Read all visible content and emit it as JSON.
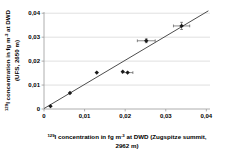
{
  "chart_data": {
    "type": "scatter",
    "title": "",
    "xlabel_plain": "129I concentration in fg m-3 at DWD (Zugspitze summit, 2962 m)",
    "ylabel_plain": "129I concentration in fg m-3 at DWD (UFS, 2650 m)",
    "xlabel_lines": [
      [
        {
          "sup": "129"
        },
        {
          "t": "I concentration in fg m"
        },
        {
          "sup": "-3"
        },
        {
          "t": " at DWD (Zugspitze summit,"
        }
      ],
      [
        {
          "t": "2962 m)"
        }
      ]
    ],
    "ylabel_lines": [
      [
        {
          "sup": "129"
        },
        {
          "t": "I concentration in fg m"
        },
        {
          "sup": "-3"
        },
        {
          "t": " at DWD"
        }
      ],
      [
        {
          "t": "(UFS, 2650 m)"
        }
      ]
    ],
    "x_ticks": [
      {
        "value": 0,
        "label": "0"
      },
      {
        "value": 0.01,
        "label": "0,01"
      },
      {
        "value": 0.02,
        "label": "0,02"
      },
      {
        "value": 0.03,
        "label": "0,03"
      },
      {
        "value": 0.04,
        "label": "0,04"
      }
    ],
    "y_ticks": [
      {
        "value": 0,
        "label": "0"
      },
      {
        "value": 0.01,
        "label": "0,01"
      },
      {
        "value": 0.02,
        "label": "0,02"
      },
      {
        "value": 0.03,
        "label": "0,03"
      },
      {
        "value": 0.04,
        "label": "0,04"
      }
    ],
    "xlim": [
      0,
      0.0409
    ],
    "ylim": [
      0,
      0.0411
    ],
    "grid": "horizontal-only",
    "legend": "none",
    "points": [
      {
        "x": 0.0016,
        "y": 0.0012,
        "xerr": 0.0004,
        "yerr": 0
      },
      {
        "x": 0.0064,
        "y": 0.0067,
        "xerr": 0.0004,
        "yerr": 0
      },
      {
        "x": 0.013,
        "y": 0.0152,
        "xerr": 0.0004,
        "yerr": 0
      },
      {
        "x": 0.0194,
        "y": 0.0156,
        "xerr": 0.0005,
        "yerr": 0
      },
      {
        "x": 0.0206,
        "y": 0.0152,
        "xerr": 0.0013,
        "yerr": 0
      },
      {
        "x": 0.0252,
        "y": 0.0285,
        "xerr": 0.0022,
        "yerr": 0.0008
      },
      {
        "x": 0.0339,
        "y": 0.0347,
        "xerr": 0.002,
        "yerr": 0.0015
      }
    ],
    "trendline": {
      "x1": 0.0,
      "y1": 0.0002,
      "x2": 0.0405,
      "y2": 0.041
    },
    "colors": {
      "background": "#ffffff",
      "marker": "#1a1a1a",
      "trendline": "#4d4d4d",
      "errorbar": "#595959",
      "gridline": "#d2d2d2",
      "axis": "#9a9a9a",
      "text": "#000000"
    }
  }
}
